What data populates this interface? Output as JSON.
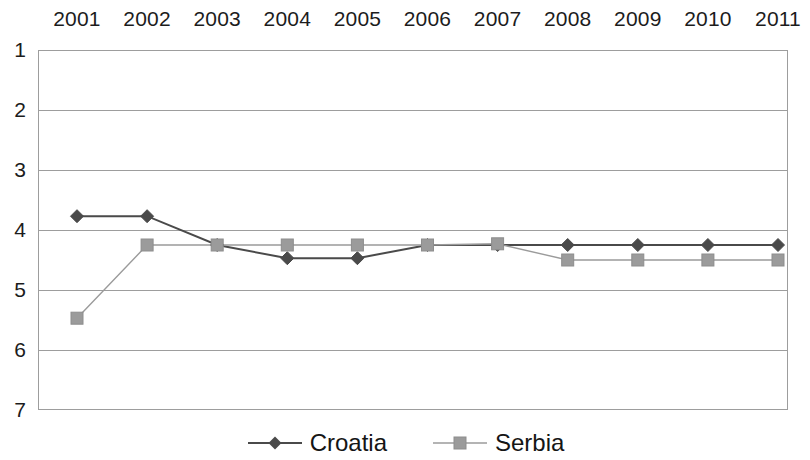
{
  "chart_data": {
    "type": "line",
    "title": "",
    "subtitle": "",
    "xlabel": "",
    "ylabel": "",
    "categories": [
      "2001",
      "2002",
      "2003",
      "2004",
      "2005",
      "2006",
      "2007",
      "2008",
      "2009",
      "2010",
      "2011"
    ],
    "series": [
      {
        "name": "Croatia",
        "color": "#4a4a4a",
        "marker": "diamond",
        "values": [
          3.77,
          3.77,
          4.25,
          4.47,
          4.47,
          4.25,
          4.25,
          4.25,
          4.25,
          4.25,
          4.25
        ]
      },
      {
        "name": "Serbia",
        "color": "#9b9b9b",
        "marker": "square",
        "values": [
          5.47,
          4.25,
          4.25,
          4.25,
          4.25,
          4.25,
          4.23,
          4.5,
          4.5,
          4.5,
          4.5
        ]
      }
    ],
    "ylim": [
      1,
      7
    ],
    "y_ticks": [
      1,
      2,
      3,
      4,
      5,
      6,
      7
    ],
    "y_axis_inverted": true,
    "x_axis_position": "top",
    "grid": true,
    "grid_color": "#9d9d9d",
    "legend_position": "bottom",
    "plot_bg": "#ffffff",
    "border_color": "#9d9d9d"
  },
  "legend": {
    "entries": [
      {
        "label": "Croatia"
      },
      {
        "label": "Serbia"
      }
    ]
  }
}
